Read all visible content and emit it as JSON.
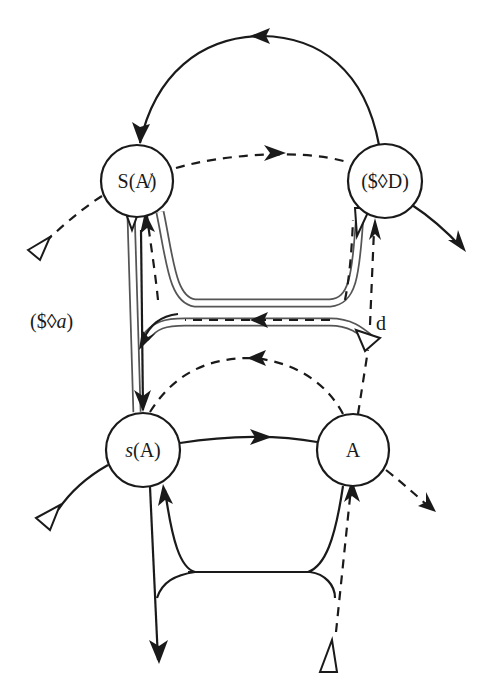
{
  "diagram": {
    "title": "",
    "nodes": {
      "barred_signifier": {
        "label": "S(A̸)",
        "italic": false
      },
      "drive": {
        "label": "($◊D)",
        "italic": false
      },
      "signified": {
        "label": "s(A)",
        "label_prefix": "s",
        "label_suffix": "(A)"
      },
      "other": {
        "label": "A"
      }
    },
    "labels": {
      "fantasy": "($◊a)",
      "fantasy_prefix": "($◊",
      "fantasy_var": "a",
      "fantasy_suffix": ")",
      "desire": "d"
    },
    "edges": [
      {
        "from": "drive",
        "to": "barred_signifier",
        "style": "solid",
        "shape": "upper-arc"
      },
      {
        "from": "barred_signifier",
        "to": "drive",
        "style": "dashed"
      },
      {
        "from": "signified",
        "to": "other",
        "style": "solid"
      },
      {
        "from": "other",
        "to": "signified",
        "style": "dashed",
        "shape": "arc"
      },
      {
        "from": "desire-junction",
        "to": "fantasy-junction",
        "style": "dashed",
        "shape": "double-channel"
      },
      {
        "from": "barred_signifier",
        "to": "signified",
        "style": "double",
        "label": "($◊a)"
      },
      {
        "from": "other",
        "to": "drive",
        "style": "dashed",
        "label": "d"
      },
      {
        "from": "signified",
        "to": "exit-bottom",
        "style": "solid"
      },
      {
        "from": "entry-bottom",
        "to": "other",
        "style": "dashed"
      }
    ],
    "colors": {
      "ink": "#1a1a1a",
      "channel": "#555555",
      "background": "#ffffff"
    }
  }
}
